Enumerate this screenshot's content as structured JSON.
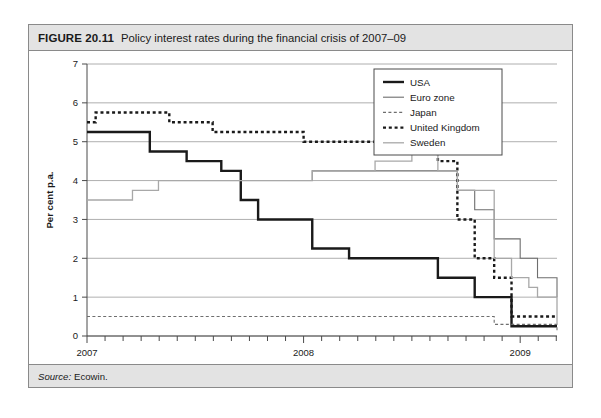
{
  "figure": {
    "number": "FIGURE 20.11",
    "title": "Policy interest rates during the financial crisis of 2007–09",
    "source_label": "Source:",
    "source_value": "Ecowin."
  },
  "chart_data": {
    "type": "line",
    "title": "Policy interest rates during the financial crisis of 2007–09",
    "xlabel": "",
    "ylabel": "Per cent p.a.",
    "xlim": [
      2007.0,
      2009.17
    ],
    "ylim": [
      0,
      7
    ],
    "yticks": [
      0,
      1,
      2,
      3,
      4,
      5,
      6,
      7
    ],
    "ytick_labels": [
      "0",
      "1",
      "2",
      "3",
      "4",
      "5",
      "6",
      "7"
    ],
    "xticks": [
      2007,
      2008,
      2009
    ],
    "xtick_labels": [
      "2007",
      "2008",
      "2009"
    ],
    "x_minor_tick_interval_months": 2,
    "grid": "horizontal",
    "legend_position": "top-right",
    "interpolation": "step-post",
    "series": [
      {
        "name": "USA",
        "style": "solid",
        "color": "#1a1a1a",
        "width": 2.4,
        "x": [
          2007.0,
          2007.29,
          2007.46,
          2007.62,
          2007.71,
          2007.79,
          2008.04,
          2008.21,
          2008.62,
          2008.79,
          2008.96,
          2009.17
        ],
        "y": [
          5.25,
          4.75,
          4.5,
          4.25,
          3.5,
          3.0,
          2.25,
          2.0,
          1.5,
          1.0,
          0.25,
          0.25
        ]
      },
      {
        "name": "Euro zone",
        "style": "solid",
        "color": "#6e6e6e",
        "width": 1.1,
        "x": [
          2007.42,
          2008.04,
          2008.54,
          2008.71,
          2008.79,
          2008.88,
          2009.0,
          2009.08,
          2009.17
        ],
        "y": [
          4.0,
          4.25,
          4.25,
          3.75,
          3.25,
          2.5,
          2.0,
          1.5,
          1.0
        ]
      },
      {
        "name": "Japan",
        "style": "dotted-thin",
        "color": "#6e6e6e",
        "width": 1.1,
        "x": [
          2007.0,
          2008.62,
          2008.88,
          2009.17
        ],
        "y": [
          0.5,
          0.5,
          0.3,
          0.1
        ]
      },
      {
        "name": "United Kingdom",
        "style": "dotted-thick",
        "color": "#1a1a1a",
        "width": 2.4,
        "x": [
          2007.0,
          2007.04,
          2007.38,
          2007.58,
          2008.0,
          2008.62,
          2008.71,
          2008.79,
          2008.88,
          2008.96,
          2009.17
        ],
        "y": [
          5.5,
          5.75,
          5.5,
          5.25,
          5.0,
          4.5,
          3.0,
          2.0,
          1.5,
          0.5,
          0.5
        ]
      },
      {
        "name": "Sweden",
        "style": "solid",
        "color": "#a8a8a8",
        "width": 1.3,
        "x": [
          2007.0,
          2007.21,
          2007.33,
          2007.58,
          2008.04,
          2008.33,
          2008.5,
          2008.62,
          2008.71,
          2008.88,
          2008.96,
          2009.04,
          2009.08,
          2009.17
        ],
        "y": [
          3.5,
          3.75,
          4.0,
          4.0,
          4.25,
          4.5,
          4.75,
          4.25,
          3.75,
          2.0,
          1.5,
          1.25,
          1.0,
          0.3
        ]
      }
    ],
    "legend": [
      {
        "label": "USA",
        "style": "solid",
        "color": "#1a1a1a",
        "width": 2.4
      },
      {
        "label": "Euro zone",
        "style": "solid",
        "color": "#6e6e6e",
        "width": 1.1
      },
      {
        "label": "Japan",
        "style": "dotted-thin",
        "color": "#6e6e6e",
        "width": 1.1
      },
      {
        "label": "United Kingdom",
        "style": "dotted-thick",
        "color": "#1a1a1a",
        "width": 2.4
      },
      {
        "label": "Sweden",
        "style": "solid",
        "color": "#a8a8a8",
        "width": 1.3
      }
    ]
  }
}
